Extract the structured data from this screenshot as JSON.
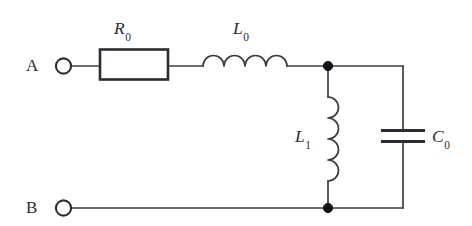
{
  "figure": {
    "kind": "electrical-circuit-schematic",
    "background_color": "#ffffff",
    "wire_color": "#3c3c46",
    "component_outline_color": "#2b2b33",
    "node_color": "#111117"
  },
  "terminals": [
    {
      "id": "A",
      "label": "A",
      "position": "top-left"
    },
    {
      "id": "B",
      "label": "B",
      "position": "bottom-left"
    }
  ],
  "components": [
    {
      "id": "R0",
      "type": "resistor",
      "symbol": "rectangle-box",
      "label_text": "R",
      "label_subscript": "0",
      "orientation": "horizontal",
      "branch": "series-top"
    },
    {
      "id": "L0",
      "type": "inductor",
      "symbol": "coil-4-arcs",
      "label_text": "L",
      "label_subscript": "0",
      "orientation": "horizontal",
      "branch": "series-top",
      "arcs": 4
    },
    {
      "id": "L1",
      "type": "inductor",
      "symbol": "coil-4-arcs",
      "label_text": "L",
      "label_subscript": "1",
      "orientation": "vertical",
      "branch": "shunt-first",
      "arcs": 4
    },
    {
      "id": "C0",
      "type": "capacitor",
      "symbol": "parallel-plates",
      "label_text": "C",
      "label_subscript": "0",
      "orientation": "vertical",
      "branch": "shunt-second"
    }
  ],
  "nodes": [
    {
      "id": "top-junction",
      "connects": [
        "L0",
        "L1",
        "C0"
      ]
    },
    {
      "id": "bottom-junction",
      "connects": [
        "B",
        "L1",
        "C0"
      ]
    }
  ],
  "labels": {
    "terminal_a": "A",
    "terminal_b": "B",
    "r0_main": "R",
    "r0_sub": "0",
    "l0_main": "L",
    "l0_sub": "0",
    "l1_main": "L",
    "l1_sub": "1",
    "c0_main": "C",
    "c0_sub": "0"
  }
}
